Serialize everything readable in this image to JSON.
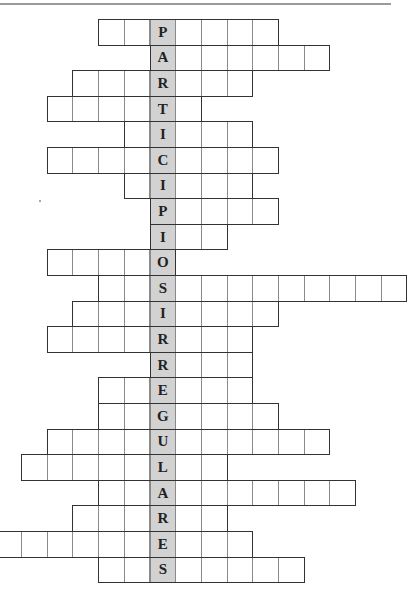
{
  "puzzle": {
    "title": "",
    "hidden_word": "PARTICIPIOS IRREGULARES",
    "key_column": 6,
    "colors": {
      "key_fill": "#d2d2d2",
      "cell_fill": "#ffffff",
      "border": "#333333"
    },
    "rows": [
      {
        "letter": "P",
        "start": 4,
        "end": 10
      },
      {
        "letter": "A",
        "start": 6,
        "end": 12
      },
      {
        "letter": "R",
        "start": 3,
        "end": 9
      },
      {
        "letter": "T",
        "start": 2,
        "end": 7
      },
      {
        "letter": "I",
        "start": 5,
        "end": 9
      },
      {
        "letter": "C",
        "start": 2,
        "end": 10
      },
      {
        "letter": "I",
        "start": 5,
        "end": 9
      },
      {
        "letter": "P",
        "start": 6,
        "end": 10
      },
      {
        "letter": "I",
        "start": 6,
        "end": 8
      },
      {
        "letter": "O",
        "start": 2,
        "end": 6
      },
      {
        "letter": "S",
        "start": 4,
        "end": 15
      },
      {
        "letter": "I",
        "start": 3,
        "end": 10
      },
      {
        "letter": "R",
        "start": 2,
        "end": 9
      },
      {
        "letter": "R",
        "start": 6,
        "end": 9
      },
      {
        "letter": "E",
        "start": 4,
        "end": 9
      },
      {
        "letter": "G",
        "start": 4,
        "end": 10
      },
      {
        "letter": "U",
        "start": 2,
        "end": 12
      },
      {
        "letter": "L",
        "start": 1,
        "end": 8
      },
      {
        "letter": "A",
        "start": 4,
        "end": 13
      },
      {
        "letter": "R",
        "start": 3,
        "end": 8
      },
      {
        "letter": "E",
        "start": 0,
        "end": 9
      },
      {
        "letter": "S",
        "start": 4,
        "end": 11
      }
    ]
  }
}
